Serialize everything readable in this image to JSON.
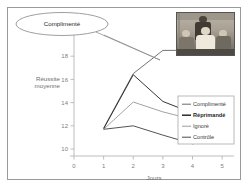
{
  "callout": {
    "label": "Complimenté"
  },
  "photo": {
    "alt": "classroom-photo-teacher-and-students"
  },
  "axes": {
    "y_title_line1": "Réussite",
    "y_title_line2": "moyenne",
    "x_title": "Jours",
    "y_ticks": [
      "10",
      "12",
      "14",
      "16",
      "18",
      "20"
    ],
    "x_ticks": [
      "0",
      "1",
      "2",
      "3",
      "4",
      "5"
    ]
  },
  "legend": {
    "items": [
      {
        "label": "Complimenté",
        "color": "#6b6b6b",
        "bold": false
      },
      {
        "label": "Réprimandé",
        "color": "#2b2b2b",
        "bold": true
      },
      {
        "label": "Ignoré",
        "color": "#9d9d9d",
        "bold": false
      },
      {
        "label": "Contrôle",
        "color": "#4a4a4a",
        "bold": false
      }
    ]
  },
  "chart_data": {
    "type": "line",
    "title": "",
    "xlabel": "Jours",
    "ylabel": "Réussite moyenne",
    "x": [
      1,
      2,
      3,
      4,
      5
    ],
    "xlim": [
      0,
      5.4
    ],
    "ylim": [
      9.4,
      20.6
    ],
    "xticks": [
      0,
      1,
      2,
      3,
      4,
      5
    ],
    "yticks": [
      10,
      12,
      14,
      16,
      18,
      20
    ],
    "grid": false,
    "legend_position": "right-inside",
    "series": [
      {
        "name": "Complimenté",
        "color": "#6b6b6b",
        "values": [
          11.8,
          16.5,
          18.5,
          18.5,
          20.4
        ]
      },
      {
        "name": "Réprimandé",
        "color": "#2b2b2b",
        "values": [
          11.75,
          16.4,
          14.1,
          13.1,
          13.9
        ]
      },
      {
        "name": "Ignoré",
        "color": "#9d9d9d",
        "values": [
          11.7,
          14.05,
          13.2,
          12.55,
          13.1
        ]
      },
      {
        "name": "Contrôle",
        "color": "#4a4a4a",
        "values": [
          11.7,
          12.0,
          11.2,
          10.45,
          10.9
        ]
      }
    ]
  }
}
